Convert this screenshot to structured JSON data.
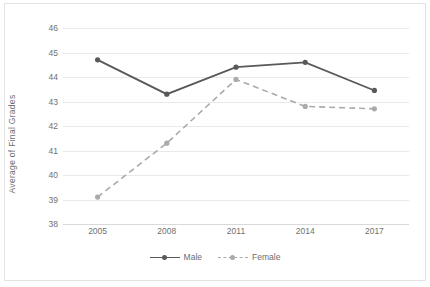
{
  "chart_data": {
    "type": "line",
    "title": "",
    "xlabel": "",
    "ylabel": "Average of Final Grades",
    "categories": [
      "2005",
      "2008",
      "2011",
      "2014",
      "2017"
    ],
    "ylim": [
      38,
      46
    ],
    "ytick_labels": [
      "46",
      "45",
      "44",
      "43",
      "42",
      "41",
      "40",
      "39",
      "38"
    ],
    "ytick_values": [
      46,
      45,
      44,
      43,
      42,
      41,
      40,
      39,
      38
    ],
    "grid": true,
    "legend_position": "bottom",
    "series": [
      {
        "name": "Male",
        "values": [
          44.7,
          43.3,
          44.4,
          44.6,
          43.45
        ],
        "color": "#595959",
        "style": "solid",
        "marker": "circle"
      },
      {
        "name": "Female",
        "values": [
          39.1,
          41.3,
          43.9,
          42.8,
          42.7
        ],
        "color": "#aaaaaa",
        "style": "dashed",
        "marker": "circle"
      }
    ]
  },
  "legend": {
    "items": [
      {
        "label": "Male"
      },
      {
        "label": "Female"
      }
    ]
  },
  "colors": {
    "male_line": "#595959",
    "female_line": "#aaaaaa",
    "gridline": "#e9e9e9",
    "axis_text": "#707070",
    "background": "#ffffff"
  }
}
